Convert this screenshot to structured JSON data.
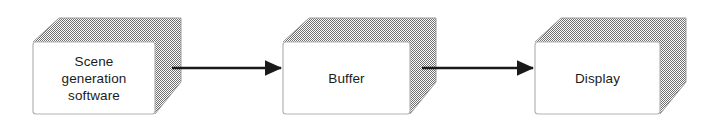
{
  "diagram": {
    "background_color": "#ffffff",
    "style": {
      "box_face_color": "#ffffff",
      "box_border_color": "#b4b4b4",
      "box_shadow_color": "#9d9d9d",
      "arrow_color": "#1a1a1a",
      "text_color": "#1b1b1b"
    },
    "nodes": [
      {
        "id": "scene-generation-software",
        "label": "Scene\ngeneration\nsoftware",
        "face": {
          "x": 33,
          "y": 42,
          "width": 122,
          "height": 72
        },
        "depth": {
          "dx": 26,
          "dy": -24
        }
      },
      {
        "id": "buffer",
        "label": "Buffer",
        "face": {
          "x": 283,
          "y": 42,
          "width": 127,
          "height": 72
        },
        "depth": {
          "dx": 26,
          "dy": -24
        }
      },
      {
        "id": "display",
        "label": "Display",
        "face": {
          "x": 535,
          "y": 42,
          "width": 125,
          "height": 72
        },
        "depth": {
          "dx": 26,
          "dy": -24
        }
      }
    ],
    "connectors": [
      {
        "id": "scene-to-buffer",
        "from": "scene-generation-software",
        "to": "buffer",
        "x1": 172,
        "x2": 283,
        "y": 68
      },
      {
        "id": "buffer-to-display",
        "from": "buffer",
        "to": "display",
        "x1": 422,
        "x2": 535,
        "y": 68
      }
    ]
  }
}
